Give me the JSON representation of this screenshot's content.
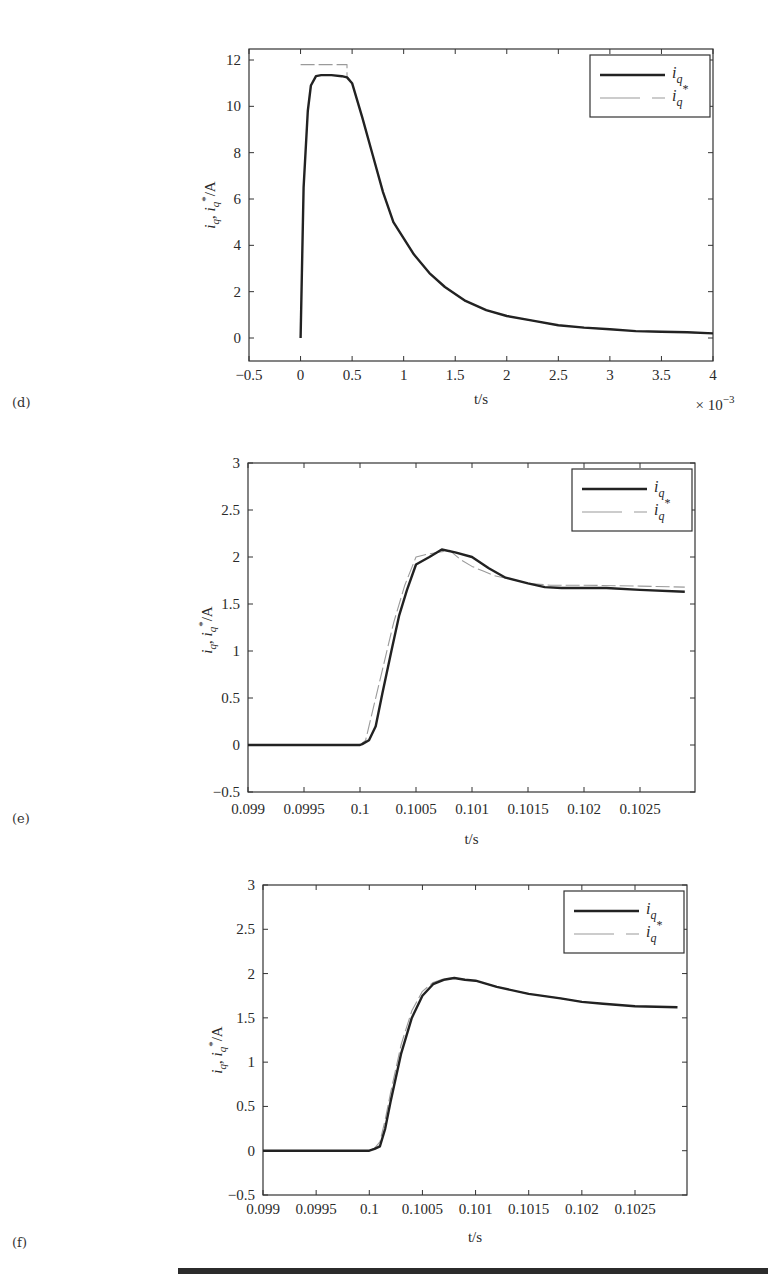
{
  "panels": [
    {
      "id": "d",
      "label": "(d)"
    },
    {
      "id": "e",
      "label": "(e)"
    },
    {
      "id": "f",
      "label": "(f)"
    }
  ],
  "colors": {
    "iq": "#222222",
    "iq_ref": "#9a9a9a",
    "axis": "#333333"
  },
  "chart_data": [
    {
      "panel": "(d)",
      "type": "line",
      "title": "",
      "xlabel": "t/s",
      "ylabel": "i_q, i_q*/A",
      "x_multiplier": "× 10^-3",
      "xlim": [
        -0.5,
        4
      ],
      "ylim": [
        -1,
        12.5
      ],
      "xticks": [
        -0.5,
        0,
        0.5,
        1,
        1.5,
        2,
        2.5,
        3,
        3.5,
        4
      ],
      "xtick_labels": [
        "−0.5",
        "0",
        "0.5",
        "1",
        "1.5",
        "2",
        "2.5",
        "3",
        "3.5",
        "4"
      ],
      "yticks": [
        0,
        2,
        4,
        6,
        8,
        10,
        12
      ],
      "ytick_labels": [
        "0",
        "2",
        "4",
        "6",
        "8",
        "10",
        "12"
      ],
      "grid": false,
      "legend": {
        "position": "upper right",
        "entries": [
          "i_q",
          "i_q*"
        ]
      },
      "series": [
        {
          "name": "i_q",
          "style": "solid-thick",
          "x": [
            0,
            0.03,
            0.07,
            0.1,
            0.15,
            0.2,
            0.3,
            0.4,
            0.45,
            0.5,
            0.6,
            0.7,
            0.8,
            0.9,
            1.0,
            1.1,
            1.25,
            1.4,
            1.6,
            1.8,
            2.0,
            2.25,
            2.5,
            2.75,
            3.0,
            3.25,
            3.5,
            3.75,
            4.0
          ],
          "y": [
            0,
            6.5,
            9.8,
            10.9,
            11.3,
            11.35,
            11.35,
            11.3,
            11.25,
            11.0,
            9.5,
            7.9,
            6.3,
            5.0,
            4.3,
            3.6,
            2.8,
            2.2,
            1.6,
            1.2,
            0.95,
            0.75,
            0.55,
            0.45,
            0.38,
            0.3,
            0.27,
            0.25,
            0.2
          ]
        },
        {
          "name": "i_q*",
          "style": "dashed-thin",
          "x": [
            0,
            0.45,
            0.45,
            0.5,
            0.6,
            0.7,
            0.8,
            0.9,
            1.0,
            1.1,
            1.25,
            1.4,
            1.6,
            1.8,
            2.0,
            2.25,
            2.5,
            2.75,
            3.0,
            3.25,
            3.5,
            3.75,
            4.0
          ],
          "y": [
            11.8,
            11.8,
            11.3,
            11.0,
            9.5,
            7.9,
            6.3,
            5.0,
            4.3,
            3.6,
            2.8,
            2.2,
            1.6,
            1.2,
            0.95,
            0.75,
            0.55,
            0.45,
            0.38,
            0.3,
            0.27,
            0.25,
            0.2
          ]
        }
      ]
    },
    {
      "panel": "(e)",
      "type": "line",
      "title": "",
      "xlabel": "t/s",
      "ylabel": "i_q, i_q*/A",
      "xlim": [
        0.099,
        0.1029
      ],
      "ylim": [
        -0.5,
        3
      ],
      "xticks": [
        0.099,
        0.0995,
        0.1,
        0.1005,
        0.101,
        0.1015,
        0.102,
        0.1025
      ],
      "xtick_labels": [
        "0.099",
        "0.0995",
        "0.1",
        "0.1005",
        "0.101",
        "0.1015",
        "0.102",
        "0.1025"
      ],
      "yticks": [
        -0.5,
        0,
        0.5,
        1,
        1.5,
        2,
        2.5,
        3
      ],
      "ytick_labels": [
        "−0.5",
        "0",
        "0.5",
        "1",
        "1.5",
        "2",
        "2.5",
        "3"
      ],
      "grid": false,
      "legend": {
        "position": "upper right",
        "entries": [
          "i_q",
          "i_q*"
        ]
      },
      "series": [
        {
          "name": "i_q",
          "style": "solid-thick",
          "x": [
            0.099,
            0.0995,
            0.1,
            0.10002,
            0.10008,
            0.10014,
            0.1002,
            0.10028,
            0.10035,
            0.10042,
            0.1005,
            0.10062,
            0.10073,
            0.10085,
            0.101,
            0.10115,
            0.1013,
            0.1015,
            0.10165,
            0.1018,
            0.102,
            0.1022,
            0.1025,
            0.1029
          ],
          "y": [
            0,
            0,
            0,
            0.01,
            0.05,
            0.2,
            0.55,
            1.0,
            1.38,
            1.65,
            1.92,
            2.0,
            2.08,
            2.05,
            2.0,
            1.88,
            1.78,
            1.72,
            1.68,
            1.67,
            1.67,
            1.67,
            1.65,
            1.63
          ]
        },
        {
          "name": "i_q*",
          "style": "dashed-thin",
          "x": [
            0.099,
            0.0995,
            0.1,
            0.10005,
            0.1001,
            0.1002,
            0.1003,
            0.1004,
            0.1005,
            0.1006,
            0.1007,
            0.1008,
            0.1009,
            0.101,
            0.1011,
            0.1012,
            0.1014,
            0.1015,
            0.1017,
            0.102,
            0.1025,
            0.1029
          ],
          "y": [
            0,
            0,
            0,
            0.05,
            0.3,
            0.8,
            1.3,
            1.7,
            2.0,
            2.03,
            2.05,
            2.07,
            1.97,
            1.9,
            1.85,
            1.8,
            1.75,
            1.72,
            1.7,
            1.7,
            1.69,
            1.68
          ]
        }
      ]
    },
    {
      "panel": "(f)",
      "type": "line",
      "title": "",
      "xlabel": "t/s",
      "ylabel": "i_q, i_q*/A",
      "xlim": [
        0.099,
        0.1029
      ],
      "ylim": [
        -0.5,
        3
      ],
      "xticks": [
        0.099,
        0.0995,
        0.1,
        0.1005,
        0.101,
        0.1015,
        0.102,
        0.1025
      ],
      "xtick_labels": [
        "0.099",
        "0.0995",
        "0.1",
        "0.1005",
        "0.101",
        "0.1015",
        "0.102",
        "0.1025"
      ],
      "yticks": [
        -0.5,
        0,
        0.5,
        1,
        1.5,
        2,
        2.5,
        3
      ],
      "ytick_labels": [
        "−0.5",
        "0",
        "0.5",
        "1",
        "1.5",
        "2",
        "2.5",
        "3"
      ],
      "grid": false,
      "legend": {
        "position": "upper right",
        "entries": [
          "i_q",
          "i_q*"
        ]
      },
      "series": [
        {
          "name": "i_q",
          "style": "solid-thick",
          "x": [
            0.099,
            0.0995,
            0.1,
            0.10005,
            0.1001,
            0.10015,
            0.1002,
            0.1003,
            0.1004,
            0.1005,
            0.1006,
            0.1007,
            0.1008,
            0.1009,
            0.101,
            0.1012,
            0.1015,
            0.1018,
            0.102,
            0.1022,
            0.1025,
            0.1029
          ],
          "y": [
            0,
            0,
            0,
            0.02,
            0.05,
            0.25,
            0.55,
            1.1,
            1.5,
            1.75,
            1.88,
            1.93,
            1.95,
            1.93,
            1.92,
            1.85,
            1.77,
            1.72,
            1.68,
            1.66,
            1.63,
            1.62
          ]
        },
        {
          "name": "i_q*",
          "style": "dashed-thin",
          "x": [
            0.099,
            0.0995,
            0.1,
            0.10005,
            0.1001,
            0.10015,
            0.1002,
            0.1003,
            0.1004,
            0.1005,
            0.1006,
            0.1007,
            0.1008,
            0.1009,
            0.101,
            0.1012,
            0.1015,
            0.1018,
            0.102,
            0.1022,
            0.1025,
            0.1029
          ],
          "y": [
            0,
            0,
            0,
            0.03,
            0.1,
            0.35,
            0.65,
            1.2,
            1.58,
            1.8,
            1.9,
            1.94,
            1.95,
            1.93,
            1.92,
            1.85,
            1.77,
            1.72,
            1.68,
            1.66,
            1.63,
            1.62
          ]
        }
      ]
    }
  ]
}
